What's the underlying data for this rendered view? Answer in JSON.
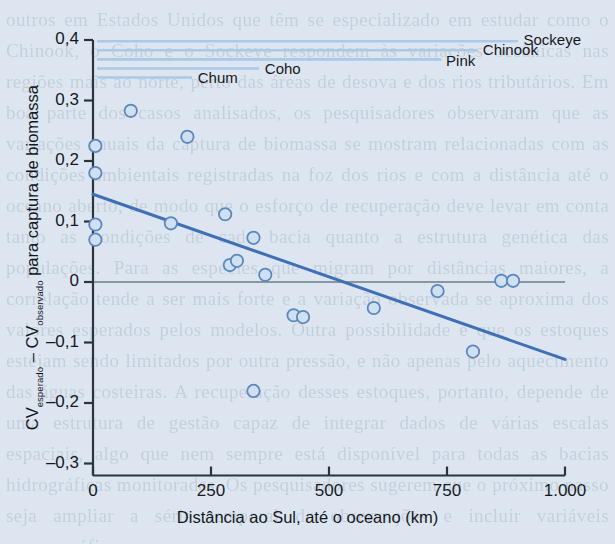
{
  "figure": {
    "background_color": "#dde6f0",
    "axis_color": "#2b3440",
    "point_fill": "#cfe0f2",
    "point_stroke": "#5b87bc",
    "trend_color": "#3f6fb5",
    "legend_line_color": "#a9c9e8"
  },
  "chart_data": {
    "type": "scatter",
    "title": "",
    "xlabel": "Distância ao Sul, até o oceano (km)",
    "ylabel": "CV esperado – CV observado para captura de biomassa",
    "ylabel_parts": {
      "cv1": "CV",
      "sub1": "esperado",
      "dash": " – ",
      "cv2": "CV",
      "sub2": "observado",
      "tail": " para captura de biomassa"
    },
    "xlim": [
      0,
      1000
    ],
    "ylim": [
      -0.3,
      0.4
    ],
    "xticks": [
      0,
      250,
      500,
      750,
      1000
    ],
    "xticklabels": [
      "0",
      "250",
      "500",
      "750",
      "1.000"
    ],
    "yticks": [
      -0.3,
      -0.2,
      -0.1,
      0,
      0.1,
      0.2,
      0.3,
      0.4
    ],
    "yticklabels": [
      "–0,3",
      "–0,2",
      "–0,1",
      "0",
      "0,1",
      "0,2",
      "0,3",
      "0,4"
    ],
    "grid": false,
    "zero_line": true,
    "legend_position": "inside-top",
    "points": [
      {
        "x": 5,
        "y": 0.225
      },
      {
        "x": 5,
        "y": 0.18
      },
      {
        "x": 5,
        "y": 0.095
      },
      {
        "x": 5,
        "y": 0.07
      },
      {
        "x": 80,
        "y": 0.283
      },
      {
        "x": 200,
        "y": 0.24
      },
      {
        "x": 165,
        "y": 0.097
      },
      {
        "x": 280,
        "y": 0.112
      },
      {
        "x": 340,
        "y": 0.073
      },
      {
        "x": 290,
        "y": 0.028
      },
      {
        "x": 305,
        "y": 0.035
      },
      {
        "x": 365,
        "y": 0.012
      },
      {
        "x": 340,
        "y": -0.18
      },
      {
        "x": 425,
        "y": -0.055
      },
      {
        "x": 445,
        "y": -0.058
      },
      {
        "x": 595,
        "y": -0.043
      },
      {
        "x": 730,
        "y": -0.015
      },
      {
        "x": 805,
        "y": -0.115
      },
      {
        "x": 865,
        "y": 0.002
      },
      {
        "x": 890,
        "y": 0.002
      }
    ],
    "trendline": {
      "x0": 0,
      "y0": 0.145,
      "x1": 1000,
      "y1": -0.128
    },
    "series_lines": [
      {
        "name": "Sockeye",
        "y": 0.398,
        "x_end": 900,
        "label_x": 912,
        "label_y": 0.4
      },
      {
        "name": "Chinook",
        "y": 0.383,
        "x_end": 814,
        "label_x": 826,
        "label_y": 0.383
      },
      {
        "name": "Pink",
        "y": 0.368,
        "x_end": 738,
        "label_x": 748,
        "label_y": 0.366
      },
      {
        "name": "Coho",
        "y": 0.353,
        "x_end": 352,
        "label_x": 364,
        "label_y": 0.352
      },
      {
        "name": "Chum",
        "y": 0.338,
        "x_end": 210,
        "label_x": 222,
        "label_y": 0.337
      }
    ]
  },
  "page_bleed_text": "outros em Estados Unidos que têm se especializado em estudar como o Chinook, o Coho e o Sockeye respondem às variações oceânicas nas regiões mais ao norte, perto das áreas de desova e dos rios tributários. Em boa parte dos casos analisados, os pesquisadores observaram que as variações anuais da captura de biomassa se mostram relacionadas com as condições ambientais registradas na foz dos rios e com a distância até o oceano aberto, de modo que o esforço de recuperação deve levar em conta tanto as condições de cada bacia quanto a estrutura genética das populações. Para as espécies que migram por distâncias maiores, a correlação tende a ser mais forte e a variação observada se aproxima dos valores esperados pelos modelos. Outra possibilidade é que os estoques estejam sendo limitados por outra pressão, e não apenas pelo aquecimento das águas costeiras. A recuperação desses estoques, portanto, depende de uma estrutura de gestão capaz de integrar dados de várias escalas espaciais, algo que nem sempre está disponível para todas as bacias hidrográficas monitoradas. Os pesquisadores sugerem que o próximo passo seja ampliar a série temporal de observações e incluir variáveis oceanográficas."
}
